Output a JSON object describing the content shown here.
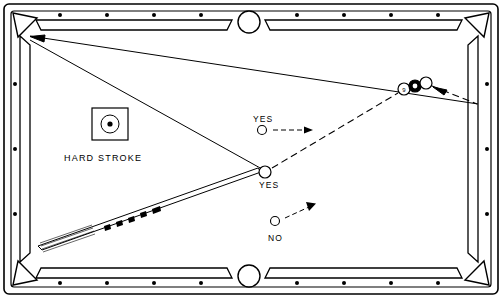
{
  "diagram": {
    "table": {
      "rail_color": "#ffffff",
      "outline_color": "#000000",
      "felt_color": "#ffffff",
      "pocket_count": 6,
      "diamond_count": 18
    },
    "labels": [
      {
        "id": "hard-stroke",
        "text": "HARD  STROKE",
        "x": 64,
        "y": 158
      },
      {
        "id": "yes-upper",
        "text": "YES",
        "x": 253,
        "y": 122
      },
      {
        "id": "yes-lower",
        "text": "YES",
        "x": 259,
        "y": 186
      },
      {
        "id": "no",
        "text": "NO",
        "x": 271,
        "y": 239
      }
    ],
    "cue_ball": {
      "id": "cue-ball",
      "cx": 265,
      "cy": 172,
      "r": 6
    },
    "object_balls": [
      {
        "id": "nine-ball",
        "label": "9",
        "cx": 404,
        "cy": 89,
        "r": 6
      },
      {
        "id": "ball-two",
        "label": "",
        "cx": 415,
        "cy": 86,
        "r": 6
      },
      {
        "id": "ball-three",
        "label": "",
        "cx": 425,
        "cy": 83,
        "r": 6
      }
    ],
    "legend_markers": [
      {
        "id": "yes-upper-dot",
        "cx": 262,
        "cy": 130,
        "r": 4.5
      },
      {
        "id": "yes-lower-dot",
        "cx": 265,
        "cy": 172,
        "r": 6
      },
      {
        "id": "no-dot",
        "cx": 275,
        "cy": 222,
        "r": 4.5
      }
    ],
    "stroke_box": {
      "id": "hard-stroke-box",
      "x": 92,
      "y": 108,
      "w": 36,
      "h": 32,
      "dot_cx": 110,
      "dot_cy": 124,
      "dot_r": 3.5
    },
    "cue_stick": {
      "tip_x": 263,
      "tip_y": 174,
      "butt_x": 40,
      "butt_y": 248
    },
    "shot_lines": [
      {
        "id": "cue-to-object-path",
        "from": [
          265,
          172
        ],
        "to": [
          400,
          92
        ],
        "style": "dashed"
      },
      {
        "id": "object-to-rail-path",
        "from": [
          430,
          86
        ],
        "to": [
          478,
          104
        ],
        "style": "dashed"
      },
      {
        "id": "rail-to-corner-path",
        "from": [
          478,
          104
        ],
        "to": [
          30,
          36
        ],
        "style": "solid"
      },
      {
        "id": "corner-return-path",
        "from": [
          30,
          40
        ],
        "to": [
          262,
          168
        ],
        "style": "solid"
      }
    ],
    "arrows": [
      {
        "id": "yes-upper-arrow",
        "from": [
          272,
          130
        ],
        "to": [
          310,
          130
        ]
      },
      {
        "id": "no-arrow",
        "from": [
          285,
          220
        ],
        "to": [
          315,
          205
        ]
      },
      {
        "id": "object-arrow",
        "from": [
          455,
          97
        ],
        "to": [
          430,
          92
        ]
      },
      {
        "id": "corner-pocket-arrow",
        "from": [
          60,
          44
        ],
        "to": [
          30,
          36
        ]
      }
    ]
  }
}
